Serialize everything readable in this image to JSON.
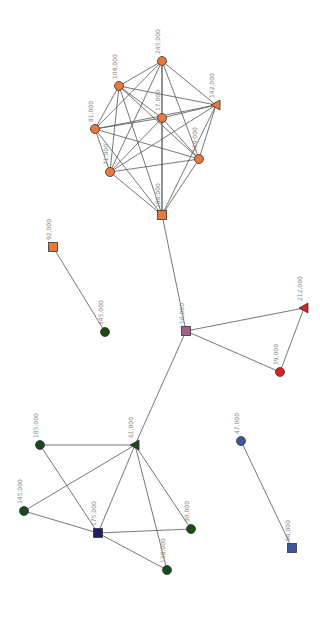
{
  "graph": {
    "nodes": [
      {
        "id": "n245",
        "label": "245,000",
        "shape": "circle",
        "color": "#e8793a",
        "x": 162,
        "y": 61
      },
      {
        "id": "n108",
        "label": "108,000",
        "shape": "circle",
        "color": "#e8793a",
        "x": 119,
        "y": 86
      },
      {
        "id": "n142",
        "label": "142,000",
        "shape": "triangle",
        "color": "#e8793a",
        "x": 216,
        "y": 105
      },
      {
        "id": "n17",
        "label": "17,000",
        "shape": "circle",
        "color": "#e8793a",
        "x": 162,
        "y": 118
      },
      {
        "id": "n81",
        "label": "81,000",
        "shape": "circle",
        "color": "#e8793a",
        "x": 95,
        "y": 129
      },
      {
        "id": "n159",
        "label": "159,000",
        "shape": "circle",
        "color": "#e8793a",
        "x": 199,
        "y": 159
      },
      {
        "id": "n71",
        "label": "71,000",
        "shape": "circle",
        "color": "#e8793a",
        "x": 110,
        "y": 172
      },
      {
        "id": "n186",
        "label": "186,000",
        "shape": "square",
        "color": "#e8793a",
        "x": 162,
        "y": 215
      },
      {
        "id": "n92",
        "label": "92,000",
        "shape": "square",
        "color": "#e8793a",
        "x": 53,
        "y": 247
      },
      {
        "id": "n345",
        "label": "345,000",
        "shape": "circle",
        "color": "#1a4a1a",
        "x": 105,
        "y": 332
      },
      {
        "id": "n56",
        "label": "56,000",
        "shape": "square",
        "color": "#a0628e",
        "x": 186,
        "y": 331
      },
      {
        "id": "n212",
        "label": "212,000",
        "shape": "triangle",
        "color": "#e02020",
        "x": 304,
        "y": 308
      },
      {
        "id": "n39",
        "label": "39,000",
        "shape": "circle",
        "color": "#e02020",
        "x": 280,
        "y": 372
      },
      {
        "id": "n61",
        "label": "61,000",
        "shape": "triangle",
        "color": "#1a4a1a",
        "x": 135,
        "y": 445
      },
      {
        "id": "n185",
        "label": "185,000",
        "shape": "circle",
        "color": "#1a4a1a",
        "x": 40,
        "y": 445
      },
      {
        "id": "n145",
        "label": "145,000",
        "shape": "circle",
        "color": "#1a4a1a",
        "x": 24,
        "y": 511
      },
      {
        "id": "n175",
        "label": "175,000",
        "shape": "square",
        "color": "#1e1e6e",
        "x": 98,
        "y": 533
      },
      {
        "id": "n90",
        "label": "90,000",
        "shape": "circle",
        "color": "#1a4a1a",
        "x": 191,
        "y": 529
      },
      {
        "id": "n138",
        "label": "138,000",
        "shape": "circle",
        "color": "#1a4a1a",
        "x": 167,
        "y": 570
      },
      {
        "id": "n47",
        "label": "47,000",
        "shape": "circle",
        "color": "#3e559b",
        "x": 241,
        "y": 441
      },
      {
        "id": "n96",
        "label": "96,000",
        "shape": "square",
        "color": "#3e559b",
        "x": 292,
        "y": 548
      }
    ],
    "edges": [
      [
        "n245",
        "n108"
      ],
      [
        "n245",
        "n142"
      ],
      [
        "n245",
        "n17"
      ],
      [
        "n245",
        "n81"
      ],
      [
        "n245",
        "n159"
      ],
      [
        "n245",
        "n71"
      ],
      [
        "n245",
        "n186"
      ],
      [
        "n108",
        "n142"
      ],
      [
        "n108",
        "n17"
      ],
      [
        "n108",
        "n81"
      ],
      [
        "n108",
        "n159"
      ],
      [
        "n108",
        "n71"
      ],
      [
        "n108",
        "n186"
      ],
      [
        "n142",
        "n17"
      ],
      [
        "n142",
        "n81"
      ],
      [
        "n142",
        "n159"
      ],
      [
        "n142",
        "n71"
      ],
      [
        "n142",
        "n186"
      ],
      [
        "n17",
        "n81"
      ],
      [
        "n17",
        "n159"
      ],
      [
        "n17",
        "n71"
      ],
      [
        "n17",
        "n186"
      ],
      [
        "n81",
        "n159"
      ],
      [
        "n81",
        "n71"
      ],
      [
        "n81",
        "n186"
      ],
      [
        "n159",
        "n71"
      ],
      [
        "n159",
        "n186"
      ],
      [
        "n71",
        "n186"
      ],
      [
        "n186",
        "n56"
      ],
      [
        "n92",
        "n345"
      ],
      [
        "n56",
        "n212"
      ],
      [
        "n56",
        "n39"
      ],
      [
        "n212",
        "n39"
      ],
      [
        "n56",
        "n61"
      ],
      [
        "n61",
        "n185"
      ],
      [
        "n61",
        "n145"
      ],
      [
        "n61",
        "n175"
      ],
      [
        "n61",
        "n90"
      ],
      [
        "n61",
        "n138"
      ],
      [
        "n185",
        "n175"
      ],
      [
        "n145",
        "n175"
      ],
      [
        "n175",
        "n90"
      ],
      [
        "n175",
        "n138"
      ],
      [
        "n47",
        "n96"
      ]
    ]
  }
}
